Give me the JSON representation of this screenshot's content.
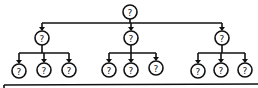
{
  "diagram": {
    "type": "tree",
    "node_label": "?",
    "colors": {
      "stroke": "#111111",
      "background": "#ffffff"
    },
    "root": {
      "label": "?",
      "x": 130,
      "y": 12
    },
    "level1": [
      {
        "label": "?",
        "x": 42,
        "y": 38,
        "children": [
          {
            "label": "?",
            "x": 19,
            "y": 71
          },
          {
            "label": "?",
            "x": 44,
            "y": 70
          },
          {
            "label": "?",
            "x": 69,
            "y": 70
          }
        ]
      },
      {
        "label": "?",
        "x": 131,
        "y": 38,
        "children": [
          {
            "label": "?",
            "x": 109,
            "y": 70
          },
          {
            "label": "?",
            "x": 131,
            "y": 70
          },
          {
            "label": "?",
            "x": 156,
            "y": 68
          }
        ]
      },
      {
        "label": "?",
        "x": 222,
        "y": 38,
        "children": [
          {
            "label": "?",
            "x": 198,
            "y": 71
          },
          {
            "label": "?",
            "x": 221,
            "y": 70
          },
          {
            "label": "?",
            "x": 245,
            "y": 70
          }
        ]
      }
    ]
  }
}
